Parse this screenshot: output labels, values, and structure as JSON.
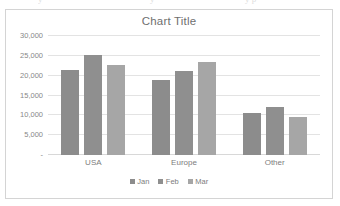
{
  "scan_artifacts": [
    {
      "text": "y",
      "left": 38
    },
    {
      "text": "y",
      "left": 150
    },
    {
      "text": "y p",
      "left": 245
    }
  ],
  "chart_data": {
    "type": "bar",
    "title": "Chart Title",
    "subtitle": "",
    "xlabel": "",
    "ylabel": "",
    "categories": [
      "USA",
      "Europe",
      "Other"
    ],
    "series": [
      {
        "name": "Jan",
        "values": [
          21400,
          19000,
          10700
        ],
        "color": "#8c8c8c"
      },
      {
        "name": "Feb",
        "values": [
          25300,
          21200,
          12000
        ],
        "color": "#8f8f8f"
      },
      {
        "name": "Mar",
        "values": [
          22700,
          23400,
          9500
        ],
        "color": "#a6a6a6"
      }
    ],
    "ylim": [
      0,
      30000
    ],
    "y_ticks": [
      {
        "value": 30000,
        "label": "30,000"
      },
      {
        "value": 25000,
        "label": "25,000"
      },
      {
        "value": 20000,
        "label": "20,000"
      },
      {
        "value": 15000,
        "label": "15,000"
      },
      {
        "value": 10000,
        "label": "10,000"
      },
      {
        "value": 5000,
        "label": "5,000"
      },
      {
        "value": 0,
        "label": "-"
      }
    ],
    "grid": true,
    "legend_position": "bottom",
    "plot_background": "#ffffff",
    "border_color": "#d4d4d4",
    "gridline_color": "#e3e3e3",
    "text_color": "#7d7d7d",
    "title_color": "#6f6f6f"
  }
}
